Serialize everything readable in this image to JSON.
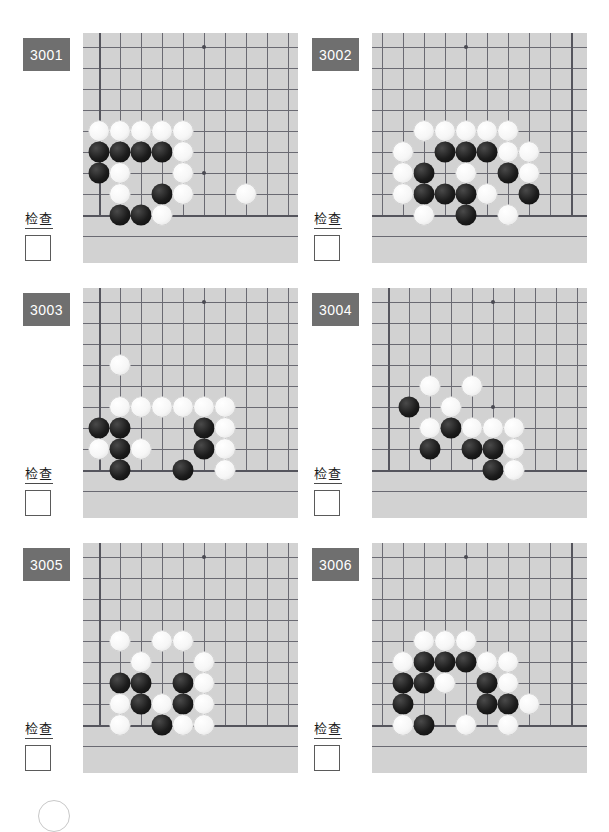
{
  "page": {
    "background_color": "#ffffff",
    "board_color": "#d2d2d2",
    "badge_color": "#6f6f6f",
    "line_color": "#6a6a72",
    "columns": 2,
    "rows": 3
  },
  "labels": {
    "check_text": "检查",
    "checkbox_value": ""
  },
  "problems": [
    {
      "id": "3001",
      "check_text": "检查",
      "checkbox_value": "",
      "corner": "bottom-left",
      "grid": {
        "cols": 10,
        "rows": 10,
        "spacing": 21,
        "origin_x": 16,
        "origin_y": 14
      },
      "star_points": [
        {
          "c": 6,
          "r": 1
        },
        {
          "c": 6,
          "r": 7
        }
      ],
      "edges": {
        "left": 1,
        "bottom": 9
      },
      "stones": [
        {
          "c": 1,
          "r": 5,
          "color": "w"
        },
        {
          "c": 2,
          "r": 5,
          "color": "w"
        },
        {
          "c": 3,
          "r": 5,
          "color": "w"
        },
        {
          "c": 4,
          "r": 5,
          "color": "w"
        },
        {
          "c": 5,
          "r": 5,
          "color": "w"
        },
        {
          "c": 1,
          "r": 6,
          "color": "b"
        },
        {
          "c": 2,
          "r": 6,
          "color": "b"
        },
        {
          "c": 3,
          "r": 6,
          "color": "b"
        },
        {
          "c": 4,
          "r": 6,
          "color": "b"
        },
        {
          "c": 5,
          "r": 6,
          "color": "w"
        },
        {
          "c": 1,
          "r": 7,
          "color": "b"
        },
        {
          "c": 2,
          "r": 7,
          "color": "w"
        },
        {
          "c": 5,
          "r": 7,
          "color": "w"
        },
        {
          "c": 2,
          "r": 8,
          "color": "w"
        },
        {
          "c": 4,
          "r": 8,
          "color": "b"
        },
        {
          "c": 5,
          "r": 8,
          "color": "w"
        },
        {
          "c": 8,
          "r": 8,
          "color": "w"
        },
        {
          "c": 2,
          "r": 9,
          "color": "b"
        },
        {
          "c": 3,
          "r": 9,
          "color": "b"
        },
        {
          "c": 4,
          "r": 9,
          "color": "w"
        }
      ]
    },
    {
      "id": "3002",
      "check_text": "检查",
      "checkbox_value": "",
      "corner": "bottom-right",
      "grid": {
        "cols": 10,
        "rows": 10,
        "spacing": 21,
        "origin_x": 16,
        "origin_y": 14
      },
      "star_points": [
        {
          "c": 6,
          "r": 1
        }
      ],
      "edges": {
        "left": 1,
        "bottom": 9
      },
      "stones": [
        {
          "c": 4,
          "r": 5,
          "color": "w"
        },
        {
          "c": 5,
          "r": 5,
          "color": "w"
        },
        {
          "c": 6,
          "r": 5,
          "color": "w"
        },
        {
          "c": 7,
          "r": 5,
          "color": "w"
        },
        {
          "c": 8,
          "r": 5,
          "color": "w"
        },
        {
          "c": 3,
          "r": 6,
          "color": "w"
        },
        {
          "c": 4,
          "r": 6,
          "color": "w"
        },
        {
          "c": 5,
          "r": 6,
          "color": "b"
        },
        {
          "c": 6,
          "r": 6,
          "color": "b"
        },
        {
          "c": 7,
          "r": 6,
          "color": "b"
        },
        {
          "c": 9,
          "r": 6,
          "color": "w"
        },
        {
          "c": 3,
          "r": 7,
          "color": "w"
        },
        {
          "c": 4,
          "r": 7,
          "color": "b"
        },
        {
          "c": 6,
          "r": 7,
          "color": "w"
        },
        {
          "c": 8,
          "r": 7,
          "color": "b"
        },
        {
          "c": 9,
          "r": 7,
          "color": "w"
        },
        {
          "c": 3,
          "r": 8,
          "color": "b"
        },
        {
          "c": 5,
          "r": 8,
          "color": "w"
        },
        {
          "c": 6,
          "r": 8,
          "color": "b"
        },
        {
          "c": 7,
          "r": 8,
          "color": "b"
        },
        {
          "c": 8,
          "r": 8,
          "color": "b"
        },
        {
          "c": 9,
          "r": 8,
          "color": "w"
        },
        {
          "c": 4,
          "r": 9,
          "color": "w"
        },
        {
          "c": 6,
          "r": 9,
          "color": "b"
        },
        {
          "c": 8,
          "r": 9,
          "color": "w"
        }
      ]
    },
    {
      "id": "3003",
      "check_text": "检查",
      "checkbox_value": "",
      "corner": "bottom-left",
      "grid": {
        "cols": 10,
        "rows": 10,
        "spacing": 21,
        "origin_x": 16,
        "origin_y": 14
      },
      "star_points": [
        {
          "c": 6,
          "r": 1
        },
        {
          "c": 6,
          "r": 7
        }
      ],
      "edges": {
        "left": 1,
        "bottom": 9
      },
      "stones": [
        {
          "c": 2,
          "r": 4,
          "color": "w"
        },
        {
          "c": 2,
          "r": 6,
          "color": "w"
        },
        {
          "c": 3,
          "r": 6,
          "color": "w"
        },
        {
          "c": 4,
          "r": 6,
          "color": "w"
        },
        {
          "c": 5,
          "r": 6,
          "color": "w"
        },
        {
          "c": 6,
          "r": 6,
          "color": "w"
        },
        {
          "c": 7,
          "r": 6,
          "color": "w"
        },
        {
          "c": 1,
          "r": 7,
          "color": "b"
        },
        {
          "c": 2,
          "r": 7,
          "color": "b"
        },
        {
          "c": 6,
          "r": 7,
          "color": "b"
        },
        {
          "c": 7,
          "r": 7,
          "color": "w"
        },
        {
          "c": 1,
          "r": 8,
          "color": "w"
        },
        {
          "c": 2,
          "r": 8,
          "color": "b"
        },
        {
          "c": 3,
          "r": 8,
          "color": "w"
        },
        {
          "c": 6,
          "r": 8,
          "color": "b"
        },
        {
          "c": 7,
          "r": 8,
          "color": "w"
        },
        {
          "c": 2,
          "r": 9,
          "color": "b"
        },
        {
          "c": 5,
          "r": 9,
          "color": "b"
        },
        {
          "c": 7,
          "r": 9,
          "color": "w"
        }
      ]
    },
    {
      "id": "3004",
      "check_text": "检查",
      "checkbox_value": "",
      "corner": "bottom-left",
      "grid": {
        "cols": 10,
        "rows": 10,
        "spacing": 21,
        "origin_x": 16,
        "origin_y": 14
      },
      "star_points": [
        {
          "c": 6,
          "r": 1
        },
        {
          "c": 6,
          "r": 6
        }
      ],
      "edges": {
        "left": 1,
        "bottom": 9
      },
      "stones": [
        {
          "c": 3,
          "r": 5,
          "color": "w"
        },
        {
          "c": 5,
          "r": 5,
          "color": "w"
        },
        {
          "c": 2,
          "r": 6,
          "color": "b"
        },
        {
          "c": 4,
          "r": 6,
          "color": "w"
        },
        {
          "c": 3,
          "r": 7,
          "color": "w"
        },
        {
          "c": 4,
          "r": 7,
          "color": "b"
        },
        {
          "c": 5,
          "r": 7,
          "color": "w"
        },
        {
          "c": 6,
          "r": 7,
          "color": "w"
        },
        {
          "c": 7,
          "r": 7,
          "color": "w"
        },
        {
          "c": 3,
          "r": 8,
          "color": "b"
        },
        {
          "c": 5,
          "r": 8,
          "color": "b"
        },
        {
          "c": 6,
          "r": 8,
          "color": "b"
        },
        {
          "c": 7,
          "r": 8,
          "color": "w"
        },
        {
          "c": 6,
          "r": 9,
          "color": "b"
        },
        {
          "c": 7,
          "r": 9,
          "color": "w"
        }
      ]
    },
    {
      "id": "3005",
      "check_text": "检查",
      "checkbox_value": "",
      "corner": "bottom-left",
      "grid": {
        "cols": 10,
        "rows": 10,
        "spacing": 21,
        "origin_x": 16,
        "origin_y": 14
      },
      "star_points": [
        {
          "c": 6,
          "r": 1
        },
        {
          "c": 6,
          "r": 6
        },
        {
          "c": 3,
          "r": 6
        }
      ],
      "edges": {
        "left": 1,
        "bottom": 9
      },
      "stones": [
        {
          "c": 2,
          "r": 5,
          "color": "w"
        },
        {
          "c": 4,
          "r": 5,
          "color": "w"
        },
        {
          "c": 5,
          "r": 5,
          "color": "w"
        },
        {
          "c": 3,
          "r": 6,
          "color": "w"
        },
        {
          "c": 6,
          "r": 6,
          "color": "w"
        },
        {
          "c": 2,
          "r": 7,
          "color": "b"
        },
        {
          "c": 3,
          "r": 7,
          "color": "b"
        },
        {
          "c": 5,
          "r": 7,
          "color": "b"
        },
        {
          "c": 6,
          "r": 7,
          "color": "w"
        },
        {
          "c": 2,
          "r": 8,
          "color": "w"
        },
        {
          "c": 3,
          "r": 8,
          "color": "b"
        },
        {
          "c": 4,
          "r": 8,
          "color": "w"
        },
        {
          "c": 5,
          "r": 8,
          "color": "b"
        },
        {
          "c": 6,
          "r": 8,
          "color": "w"
        },
        {
          "c": 2,
          "r": 9,
          "color": "w"
        },
        {
          "c": 4,
          "r": 9,
          "color": "b"
        },
        {
          "c": 5,
          "r": 9,
          "color": "w"
        },
        {
          "c": 6,
          "r": 9,
          "color": "w"
        }
      ]
    },
    {
      "id": "3006",
      "check_text": "检查",
      "checkbox_value": "",
      "corner": "bottom-right",
      "grid": {
        "cols": 10,
        "rows": 10,
        "spacing": 21,
        "origin_x": 16,
        "origin_y": 14
      },
      "star_points": [
        {
          "c": 6,
          "r": 1
        }
      ],
      "edges": {
        "left": 1,
        "bottom": 9
      },
      "stones": [
        {
          "c": 6,
          "r": 5,
          "color": "w"
        },
        {
          "c": 7,
          "r": 5,
          "color": "w"
        },
        {
          "c": 8,
          "r": 5,
          "color": "w"
        },
        {
          "c": 4,
          "r": 6,
          "color": "w"
        },
        {
          "c": 5,
          "r": 6,
          "color": "w"
        },
        {
          "c": 6,
          "r": 6,
          "color": "b"
        },
        {
          "c": 7,
          "r": 6,
          "color": "b"
        },
        {
          "c": 8,
          "r": 6,
          "color": "b"
        },
        {
          "c": 9,
          "r": 6,
          "color": "w"
        },
        {
          "c": 4,
          "r": 7,
          "color": "w"
        },
        {
          "c": 5,
          "r": 7,
          "color": "b"
        },
        {
          "c": 7,
          "r": 7,
          "color": "w"
        },
        {
          "c": 8,
          "r": 7,
          "color": "b"
        },
        {
          "c": 9,
          "r": 7,
          "color": "b"
        },
        {
          "c": 3,
          "r": 8,
          "color": "w"
        },
        {
          "c": 4,
          "r": 8,
          "color": "b"
        },
        {
          "c": 5,
          "r": 8,
          "color": "b"
        },
        {
          "c": 9,
          "r": 8,
          "color": "b"
        },
        {
          "c": 4,
          "r": 9,
          "color": "w"
        },
        {
          "c": 6,
          "r": 9,
          "color": "w"
        },
        {
          "c": 8,
          "r": 9,
          "color": "b"
        },
        {
          "c": 9,
          "r": 9,
          "color": "w"
        }
      ]
    }
  ]
}
